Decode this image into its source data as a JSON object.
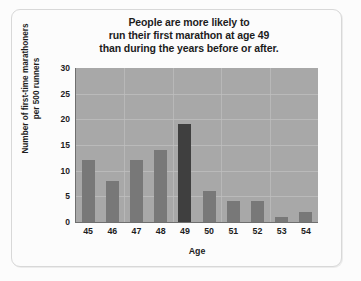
{
  "chart_data": {
    "type": "bar",
    "title": "People are more likely to run their first marathon at age 49 than during the years before or after.",
    "title_lines": [
      "People are more likely to",
      "run their first marathon at age 49",
      "than during the years before or after."
    ],
    "xlabel": "Age",
    "ylabel": "Number of first-time marathoners per 500 runners",
    "ylabel_lines": [
      "Number of first-time marathoners",
      "per 500 runners"
    ],
    "categories": [
      "45",
      "46",
      "47",
      "48",
      "49",
      "50",
      "51",
      "52",
      "53",
      "54"
    ],
    "values": [
      12,
      8,
      12,
      14,
      19,
      6,
      4,
      4,
      1,
      2
    ],
    "highlight_category": "49",
    "ylim": [
      0,
      30
    ],
    "yticks": [
      "30",
      "25",
      "20",
      "15",
      "10",
      "5",
      "0"
    ],
    "ytick_values": [
      30,
      25,
      20,
      15,
      10,
      5,
      0
    ],
    "grid": true,
    "legend": false,
    "colors": {
      "plot_background": "#a8a8a8",
      "bar": "#787878",
      "bar_highlight": "#3f3f3f",
      "gridline": "#bdbdbd",
      "axis": "#6f6f6f",
      "text": "#1d1d1d",
      "page_background": "#fcfcfc",
      "frame_border": "#d8d8d8"
    }
  }
}
